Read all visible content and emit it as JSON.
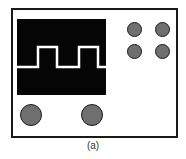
{
  "figure": {
    "caption": "(a)",
    "colors": {
      "frame": "#1a1a1a",
      "screen": "#050505",
      "trace": "#ffffff",
      "knob_fill": "#6f6f6f"
    },
    "screen": {
      "waveform": "square-wave",
      "trace_points": "0,48 21,48 21,28 40,28 40,48 62,48 62,28 81,28 81,48 89,48"
    },
    "controls": {
      "small_knobs": [
        "knob-1",
        "knob-2",
        "knob-3",
        "knob-4"
      ],
      "large_knobs": [
        "knob-left",
        "knob-right"
      ]
    }
  }
}
